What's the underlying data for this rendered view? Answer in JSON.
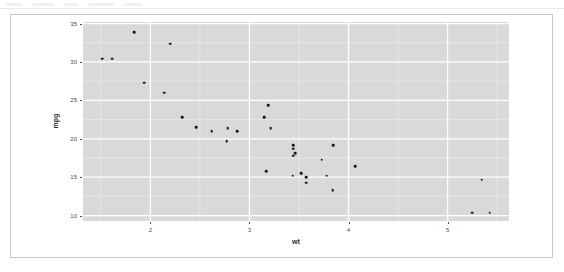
{
  "toolbar": {
    "visible": true
  },
  "caption": {
    "text": ""
  },
  "chart_data": {
    "type": "scatter",
    "title": "",
    "xlabel": "wt",
    "ylabel": "mpg",
    "xlim": [
      1.32,
      5.62
    ],
    "ylim": [
      9.3,
      35.2
    ],
    "xticks": [
      2,
      3,
      4,
      5
    ],
    "yticks": [
      10,
      15,
      20,
      25,
      30,
      35
    ],
    "xtick_labels": [
      "2",
      "3",
      "4",
      "5"
    ],
    "ytick_labels": [
      "10",
      "15",
      "20",
      "25",
      "30",
      "35"
    ],
    "grid": true,
    "grid_major_color": "#ffffff",
    "grid_minor_color": "#ededed",
    "panel_background": "#d9d9d9",
    "point_color": "#1a1a1a",
    "legend": null,
    "legend_position": "none",
    "x": [
      2.62,
      2.875,
      2.32,
      3.215,
      3.44,
      3.46,
      3.57,
      3.19,
      3.15,
      3.44,
      3.44,
      4.07,
      3.73,
      3.78,
      5.25,
      5.424,
      5.345,
      2.2,
      1.615,
      1.835,
      2.465,
      3.52,
      3.435,
      3.84,
      3.845,
      1.935,
      2.14,
      1.513,
      3.17,
      2.77,
      3.57,
      2.78
    ],
    "y": [
      21.0,
      21.0,
      22.8,
      21.4,
      18.7,
      18.1,
      14.3,
      24.4,
      22.8,
      19.2,
      17.8,
      16.4,
      17.3,
      15.2,
      10.4,
      10.4,
      14.7,
      32.4,
      30.4,
      33.9,
      21.5,
      15.5,
      15.2,
      13.3,
      19.2,
      27.3,
      26.0,
      30.4,
      15.8,
      19.7,
      15.0,
      21.4
    ]
  }
}
